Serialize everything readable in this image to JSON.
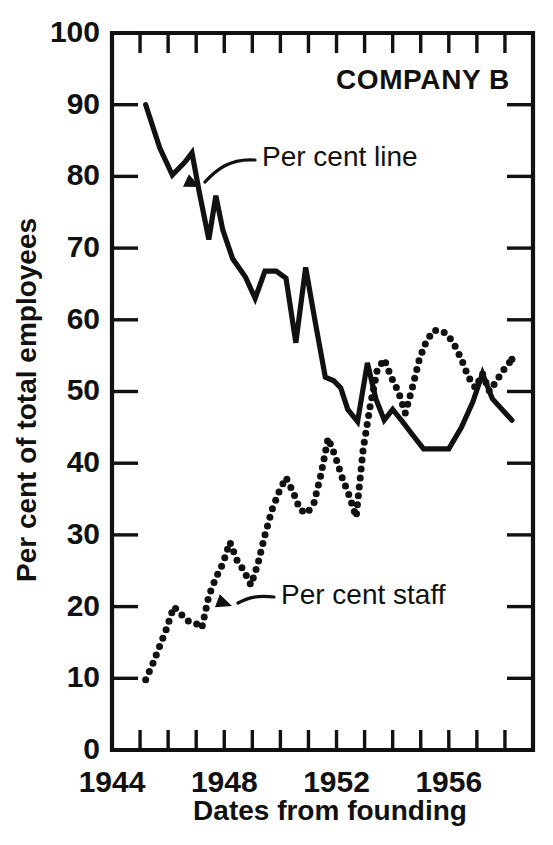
{
  "chart_data": {
    "type": "line",
    "title": "COMPANY B",
    "xlabel": "Dates from founding",
    "ylabel": "Per cent of total employees",
    "xlim": [
      1944,
      1959
    ],
    "ylim": [
      0,
      100
    ],
    "grid": false,
    "legend_position": "inline-annotations",
    "ytick_labels": [
      "0",
      "10",
      "20",
      "30",
      "40",
      "50",
      "60",
      "70",
      "80",
      "90",
      "100"
    ],
    "ytick_values": [
      0,
      10,
      20,
      30,
      40,
      50,
      60,
      70,
      80,
      90,
      100
    ],
    "xtick_labels": [
      "1944",
      "1948",
      "1952",
      "1956"
    ],
    "xtick_values": [
      1944,
      1948,
      1952,
      1956
    ],
    "xtick_minor_step": 1,
    "annotations": [
      {
        "text": "Per cent line",
        "points_to_series": "Per cent line",
        "x": 1947.0,
        "y": 79
      },
      {
        "text": "Per cent staff",
        "points_to_series": "Per cent staff",
        "x": 1948.3,
        "y": 26
      }
    ],
    "series": [
      {
        "name": "Per cent line",
        "style": "solid",
        "x": [
          1945.2,
          1945.7,
          1946.15,
          1946.6,
          1946.85,
          1947.1,
          1947.45,
          1947.7,
          1947.95,
          1948.3,
          1948.75,
          1949.1,
          1949.45,
          1949.85,
          1950.2,
          1950.55,
          1950.9,
          1951.25,
          1951.6,
          1951.9,
          1952.15,
          1952.4,
          1952.75,
          1953.1,
          1953.4,
          1953.7,
          1954.0,
          1954.35,
          1954.7,
          1955.1,
          1955.55,
          1956.0,
          1956.45,
          1956.85,
          1957.2,
          1957.55,
          1957.9,
          1958.25
        ],
        "values": [
          90.0,
          84.0,
          80.2,
          82.0,
          83.3,
          78.0,
          71.2,
          77.3,
          72.5,
          68.5,
          66.0,
          63.0,
          66.8,
          66.8,
          65.8,
          56.8,
          67.3,
          59.5,
          52.0,
          51.5,
          50.5,
          47.5,
          45.8,
          54.0,
          49.0,
          46.0,
          47.5,
          45.8,
          44.0,
          42.0,
          42.0,
          42.0,
          45.0,
          48.5,
          52.5,
          49.0,
          47.5,
          46.0
        ]
      },
      {
        "name": "Per cent staff",
        "style": "dotted",
        "x": [
          1945.2,
          1945.45,
          1945.7,
          1945.95,
          1946.2,
          1946.45,
          1946.7,
          1946.95,
          1947.2,
          1947.45,
          1947.7,
          1947.95,
          1948.2,
          1948.45,
          1948.7,
          1948.95,
          1949.2,
          1949.45,
          1949.7,
          1949.95,
          1950.2,
          1950.45,
          1950.7,
          1950.95,
          1951.2,
          1951.45,
          1951.7,
          1951.95,
          1952.2,
          1952.45,
          1952.7,
          1952.95,
          1953.2,
          1953.45,
          1953.7,
          1953.95,
          1954.2,
          1954.45,
          1954.7,
          1954.95,
          1955.2,
          1955.45,
          1955.7,
          1955.95,
          1956.2,
          1956.45,
          1956.7,
          1956.95,
          1957.2,
          1957.45,
          1957.7,
          1957.95,
          1958.25
        ],
        "values": [
          9.8,
          12.0,
          14.5,
          17.0,
          20.0,
          19.0,
          18.0,
          17.8,
          17.0,
          21.5,
          24.0,
          26.0,
          29.0,
          26.5,
          25.0,
          23.0,
          26.0,
          30.0,
          33.5,
          36.0,
          38.0,
          36.0,
          33.5,
          33.0,
          34.5,
          38.5,
          43.5,
          41.0,
          38.0,
          35.5,
          32.5,
          42.0,
          48.0,
          53.0,
          54.5,
          52.0,
          50.0,
          47.0,
          50.5,
          54.5,
          57.0,
          58.5,
          58.5,
          58.0,
          56.5,
          54.5,
          52.0,
          50.5,
          52.5,
          50.0,
          51.5,
          53.0,
          54.5
        ]
      }
    ]
  }
}
